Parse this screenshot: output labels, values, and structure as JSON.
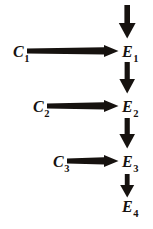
{
  "figure": {
    "type": "causal-chain-diagram",
    "background_color": "#ffffff",
    "ink_color": "#16120f",
    "width": 153,
    "height": 229
  },
  "nodes": {
    "causes": [
      {
        "id": "c1",
        "base": "C",
        "subscript": "1",
        "label": "C1"
      },
      {
        "id": "c2",
        "base": "C",
        "subscript": "2",
        "label": "C2"
      },
      {
        "id": "c3",
        "base": "C",
        "subscript": "3",
        "label": "C3"
      }
    ],
    "effects": [
      {
        "id": "e1",
        "base": "E",
        "subscript": "1",
        "label": "E1"
      },
      {
        "id": "e2",
        "base": "E",
        "subscript": "2",
        "label": "E2"
      },
      {
        "id": "e3",
        "base": "E",
        "subscript": "3",
        "label": "E3"
      },
      {
        "id": "e4",
        "base": "E",
        "subscript": "4",
        "label": "E4"
      }
    ]
  },
  "arrows": {
    "horizontal": [
      {
        "id": "arrow-c1-e1",
        "from": "C1",
        "to": "E1",
        "direction": "right"
      },
      {
        "id": "arrow-c2-e2",
        "from": "C2",
        "to": "E2",
        "direction": "right"
      },
      {
        "id": "arrow-c3-e3",
        "from": "C3",
        "to": "E3",
        "direction": "right"
      }
    ],
    "vertical": [
      {
        "id": "arrow-top-e1",
        "from": "",
        "to": "E1",
        "direction": "down"
      },
      {
        "id": "arrow-e1-e2",
        "from": "E1",
        "to": "E2",
        "direction": "down"
      },
      {
        "id": "arrow-e2-e3",
        "from": "E2",
        "to": "E3",
        "direction": "down"
      },
      {
        "id": "arrow-e3-e4",
        "from": "E3",
        "to": "E4",
        "direction": "down"
      }
    ]
  }
}
